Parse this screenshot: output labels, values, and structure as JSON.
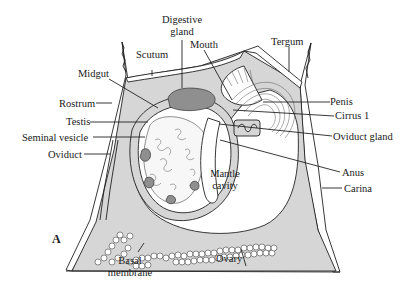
{
  "figure": {
    "panel_label": "A"
  },
  "labels": {
    "digestive_gland_line1": "Digestive",
    "digestive_gland_line2": "gland",
    "scutum": "Scutum",
    "mouth": "Mouth",
    "tergum": "Tergum",
    "midgut": "Midgut",
    "rostrum": "Rostrum",
    "testis": "Testis",
    "seminal_vesicle": "Seminal vesicle",
    "oviduct": "Oviduct",
    "penis": "Penis",
    "cirrus_1": "Cirrus 1",
    "oviduct_gland": "Oviduct gland",
    "mantle_cavity_line1": "Mantle",
    "mantle_cavity_line2": "cavity",
    "anus": "Anus",
    "carina": "Carina",
    "basal_membrane_line1": "Basal",
    "basal_membrane_line2": "membrane",
    "ovary": "Ovary"
  },
  "colors": {
    "line": "#222222",
    "tissue": "#d6d6d6",
    "dark_tissue": "#8f8f8f",
    "background": "#ffffff"
  }
}
